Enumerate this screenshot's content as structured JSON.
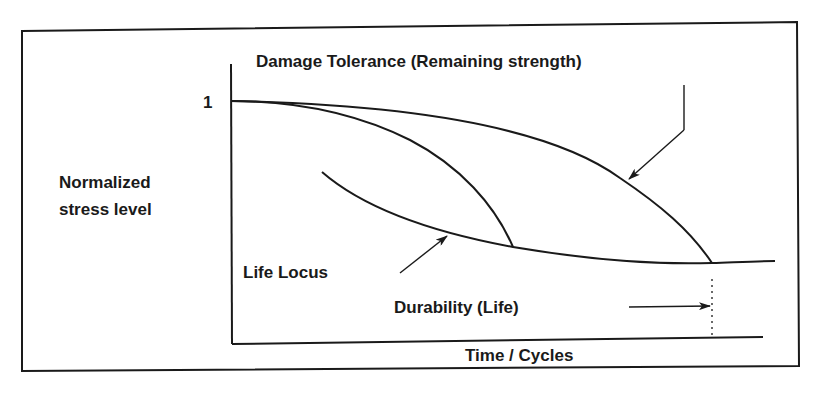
{
  "diagram": {
    "y_axis_label_line1": "Normalized",
    "y_axis_label_line2": "stress level",
    "x_axis_label": "Time / Cycles",
    "y_tick_label": "1",
    "curves": {
      "damage_tolerance_label": "Damage Tolerance (Remaining strength)",
      "life_locus_label": "Life Locus",
      "durability_label": "Durability (Life)"
    },
    "colors": {
      "ink": "#1a1a1a",
      "background": "#ffffff"
    }
  }
}
